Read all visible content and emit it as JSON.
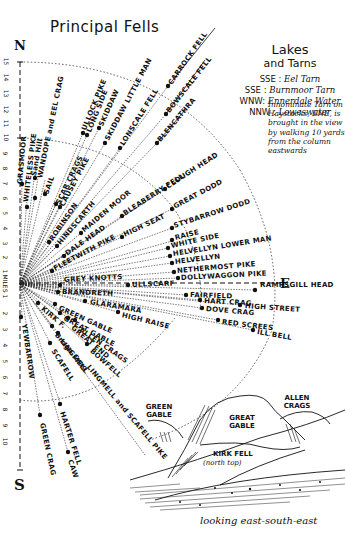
{
  "title": "Principal Fells",
  "compass": {
    "north": "N",
    "south": "S",
    "east": "E"
  },
  "scale": {
    "unit": "MILES",
    "north_ticks": [
      "1",
      "2",
      "3",
      "4",
      "5",
      "6",
      "7",
      "8",
      "9",
      "10",
      "11",
      "12",
      "13",
      "14",
      "15"
    ],
    "south_ticks": [
      "1",
      "2",
      "3",
      "4",
      "5",
      "6",
      "7",
      "8",
      "9",
      "10"
    ]
  },
  "lakes": {
    "heading_1": "Lakes",
    "heading_2": "and Tarns",
    "rows": [
      {
        "dir": "SSE",
        "name": "Eel Tarn"
      },
      {
        "dir": "SSE",
        "name": "Burnmoor Tarn"
      },
      {
        "dir": "WNW",
        "name": "Ennerdale Water"
      },
      {
        "dir": "NNW",
        "name": "Loweswater"
      }
    ],
    "note": "Innominate Tarn on Haystacks, ENE, is brought in the view by walking 10 yards from the column eastwards"
  },
  "fells": [
    {
      "name": "GRASMOOR"
    },
    {
      "name": "WHITELESS PIKE"
    },
    {
      "name": "Sand Hill"
    },
    {
      "name": "WANDOPE and EEL CRAG"
    },
    {
      "name": "SAIL"
    },
    {
      "name": "ULLOCK PIKE"
    },
    {
      "name": "LONG SIDE"
    },
    {
      "name": "SKIDDAW"
    },
    {
      "name": "SKIDDAW LITTLE MAN"
    },
    {
      "name": "LONSCALE FELL"
    },
    {
      "name": "CARROCK FELL"
    },
    {
      "name": "BOWSCALE FELL"
    },
    {
      "name": "BLENCATHRA"
    },
    {
      "name": "SCAR CRAGS"
    },
    {
      "name": "CAUSEY PIKE"
    },
    {
      "name": "ROBINSON"
    },
    {
      "name": "HINDSCARTH"
    },
    {
      "name": "MAIDEN MOOR"
    },
    {
      "name": "BLEABERRY FELL"
    },
    {
      "name": "CLOUGH HEAD"
    },
    {
      "name": "DALE HEAD"
    },
    {
      "name": "FLEETWITH PIKE"
    },
    {
      "name": "HIGH SEAT"
    },
    {
      "name": "GREAT DODD"
    },
    {
      "name": "STYBARROW DODD"
    },
    {
      "name": "RAISE"
    },
    {
      "name": "WHITE SIDE"
    },
    {
      "name": "HELVELLYN LOWER MAN"
    },
    {
      "name": "HELVELLYN"
    },
    {
      "name": "NETHERMOST PIKE"
    },
    {
      "name": "DOLLYWAGGON PIKE"
    },
    {
      "name": "GREY KNOTTS"
    },
    {
      "name": "ULLSCARF"
    },
    {
      "name": "RAMPSGILL HEAD"
    },
    {
      "name": "BRANDRETH"
    },
    {
      "name": "FAIRFIELD"
    },
    {
      "name": "HART CRAG"
    },
    {
      "name": "HIGH STREET"
    },
    {
      "name": "DOVE CRAG"
    },
    {
      "name": "GLARAMARA"
    },
    {
      "name": "HIGH RAISE"
    },
    {
      "name": "RED SCREES"
    },
    {
      "name": "ILL BELL"
    },
    {
      "name": "GREEN GABLE"
    },
    {
      "name": "GREAT GABLE"
    },
    {
      "name": "KIRK F."
    },
    {
      "name": "ALLEN CRAGS"
    },
    {
      "name": "GREAT END"
    },
    {
      "name": "BOWFELL"
    },
    {
      "name": "Brogo Crag"
    },
    {
      "name": "LINGMELL"
    },
    {
      "name": "SCAFELL"
    },
    {
      "name": "LINGMELL and SCAFELL PIKE"
    },
    {
      "name": "YEWBARROW"
    },
    {
      "name": "HARTER FELL"
    },
    {
      "name": "GREEN CRAG"
    },
    {
      "name": "CAW"
    }
  ],
  "sketch": {
    "labels": {
      "green_gable": "GREEN GABLE",
      "great_gable": "GREAT GABLE",
      "allen_crags": "ALLEN CRAGS",
      "kirk_fell": "KIRK FELL",
      "kirk_fell_sub": "(north top)"
    },
    "caption": "looking east-south-east"
  }
}
